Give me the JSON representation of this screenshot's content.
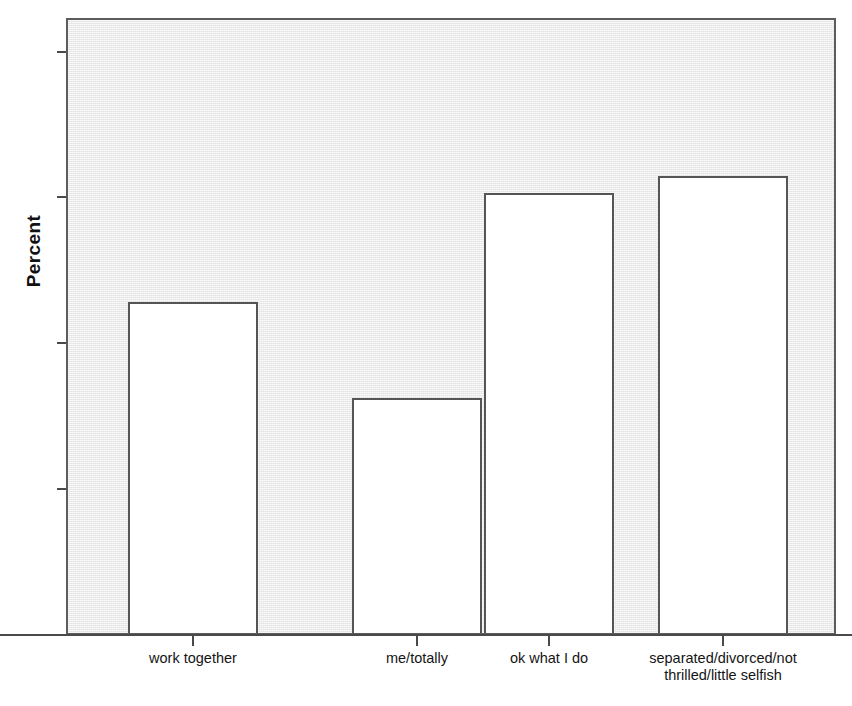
{
  "chart_data": {
    "type": "bar",
    "title": "",
    "xlabel": "",
    "ylabel": "Percent",
    "categories": [
      "work together",
      "me/totally",
      "ok what I do",
      "separated/divorced/not\nthrilled/little selfish"
    ],
    "values": [
      22.7,
      16.1,
      30.2,
      31.3
    ],
    "ylim": [
      0,
      42.3
    ],
    "yticks": [
      0,
      10,
      20,
      30,
      40
    ],
    "ytick_labels": [
      "0",
      "10",
      "20",
      "30",
      "40"
    ],
    "grid": false,
    "legend": null,
    "legend_position": "none",
    "bar_fill_color": "#ffffff",
    "bar_edge_color": "#555555",
    "panel_background_color": "#f1f1f1",
    "axis_color": "#4a4a4a",
    "text_color": "#111111"
  },
  "axis": {
    "y_title": "Percent"
  }
}
